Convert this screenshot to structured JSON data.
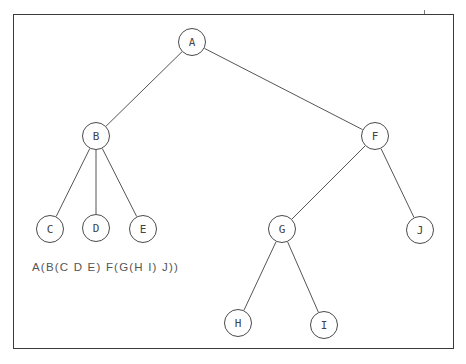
{
  "diagram": {
    "type": "tree",
    "notation": "A(B(C D E) F(G(H I) J))",
    "nodes": [
      {
        "id": "A",
        "label": "A",
        "x": 192,
        "y": 42
      },
      {
        "id": "B",
        "label": "B",
        "x": 96,
        "y": 136
      },
      {
        "id": "F",
        "label": "F",
        "x": 375,
        "y": 136
      },
      {
        "id": "C",
        "label": "C",
        "x": 50,
        "y": 229
      },
      {
        "id": "D",
        "label": "D",
        "x": 96,
        "y": 228
      },
      {
        "id": "E",
        "label": "E",
        "x": 143,
        "y": 229
      },
      {
        "id": "G",
        "label": "G",
        "x": 282,
        "y": 229
      },
      {
        "id": "J",
        "label": "J",
        "x": 420,
        "y": 230
      },
      {
        "id": "H",
        "label": "H",
        "x": 238,
        "y": 323
      },
      {
        "id": "I",
        "label": "I",
        "x": 324,
        "y": 325
      }
    ],
    "edges": [
      [
        "A",
        "B"
      ],
      [
        "A",
        "F"
      ],
      [
        "B",
        "C"
      ],
      [
        "B",
        "D"
      ],
      [
        "B",
        "E"
      ],
      [
        "F",
        "G"
      ],
      [
        "F",
        "J"
      ],
      [
        "G",
        "H"
      ],
      [
        "G",
        "I"
      ]
    ],
    "node_radius": 14
  }
}
